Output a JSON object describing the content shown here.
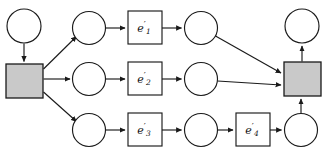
{
  "diagram": {
    "title": "",
    "type": "directed-graph",
    "canvas": {
      "width": 328,
      "height": 158
    },
    "colors": {
      "stroke": "#1a1a1a",
      "node_fill": "#ffffff",
      "shaded_fill": "#c9c9c9",
      "background": "#ffffff"
    },
    "nodes": [
      {
        "id": "c-start-top",
        "shape": "circle",
        "label": "",
        "cx": 24,
        "cy": 26,
        "r": 17
      },
      {
        "id": "sq-left",
        "shape": "square",
        "label": "",
        "x": 6,
        "y": 64,
        "w": 37,
        "h": 34
      },
      {
        "id": "c-r1-a",
        "shape": "circle",
        "label": "",
        "cx": 89,
        "cy": 28,
        "r": 16.5
      },
      {
        "id": "c-r2-a",
        "shape": "circle",
        "label": "",
        "cx": 89,
        "cy": 79,
        "r": 16.5
      },
      {
        "id": "c-r3-a",
        "shape": "circle",
        "label": "",
        "cx": 89,
        "cy": 130,
        "r": 16.5
      },
      {
        "id": "box-e1",
        "shape": "box",
        "label": "e'1",
        "x": 128,
        "y": 11,
        "w": 34,
        "h": 33
      },
      {
        "id": "box-e2",
        "shape": "box",
        "label": "e'2",
        "x": 128,
        "y": 62,
        "w": 34,
        "h": 33
      },
      {
        "id": "box-e3",
        "shape": "box",
        "label": "e'3",
        "x": 128,
        "y": 113,
        "w": 34,
        "h": 33
      },
      {
        "id": "box-e4",
        "shape": "box",
        "label": "e'4",
        "x": 236,
        "y": 113,
        "w": 34,
        "h": 33
      },
      {
        "id": "c-r1-b",
        "shape": "circle",
        "label": "",
        "cx": 201,
        "cy": 28,
        "r": 16.5
      },
      {
        "id": "c-r2-b",
        "shape": "circle",
        "label": "",
        "cx": 201,
        "cy": 79,
        "r": 16.5
      },
      {
        "id": "c-r3-b",
        "shape": "circle",
        "label": "",
        "cx": 201,
        "cy": 130,
        "r": 16.5
      },
      {
        "id": "c-r3-c",
        "shape": "circle",
        "label": "",
        "cx": 301,
        "cy": 130,
        "r": 16.5
      },
      {
        "id": "sq-right",
        "shape": "square",
        "label": "",
        "x": 284,
        "y": 62,
        "w": 37,
        "h": 34
      },
      {
        "id": "c-end-top",
        "shape": "circle",
        "label": "",
        "cx": 302,
        "cy": 26,
        "r": 17
      }
    ],
    "edges": [
      {
        "from": "c-start-top",
        "to": "sq-left"
      },
      {
        "from": "sq-left",
        "to": "c-r1-a"
      },
      {
        "from": "sq-left",
        "to": "c-r2-a"
      },
      {
        "from": "sq-left",
        "to": "c-r3-a"
      },
      {
        "from": "c-r1-a",
        "to": "box-e1"
      },
      {
        "from": "box-e1",
        "to": "c-r1-b"
      },
      {
        "from": "c-r1-b",
        "to": "sq-right"
      },
      {
        "from": "c-r2-a",
        "to": "box-e2"
      },
      {
        "from": "box-e2",
        "to": "c-r2-b"
      },
      {
        "from": "c-r2-b",
        "to": "sq-right"
      },
      {
        "from": "c-r3-a",
        "to": "box-e3"
      },
      {
        "from": "box-e3",
        "to": "c-r3-b"
      },
      {
        "from": "c-r3-b",
        "to": "box-e4"
      },
      {
        "from": "box-e4",
        "to": "c-r3-c"
      },
      {
        "from": "c-r3-c",
        "to": "sq-right"
      },
      {
        "from": "sq-right",
        "to": "c-end-top"
      }
    ],
    "labels": {
      "e1_base": "e",
      "e1_prime": "′",
      "e1_sub": "1",
      "e2_base": "e",
      "e2_prime": "′",
      "e2_sub": "2",
      "e3_base": "e",
      "e3_prime": "′",
      "e3_sub": "3",
      "e4_base": "e",
      "e4_prime": "′",
      "e4_sub": "4"
    }
  }
}
